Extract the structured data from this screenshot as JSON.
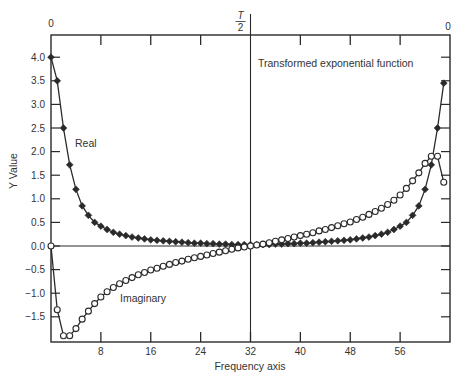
{
  "chart_data": {
    "type": "line",
    "title": "Transformed exponential function",
    "xlabel": "Frequency axis",
    "ylabel": "Y Value",
    "xlim": [
      0,
      64
    ],
    "ylim": [
      -2.0,
      4.3
    ],
    "x_ticks": [
      8,
      16,
      24,
      32,
      40,
      48,
      56
    ],
    "x_tick_labels": [
      "8",
      "16",
      "24",
      "32",
      "40",
      "48",
      "56"
    ],
    "y_ticks": [
      4.0,
      3.5,
      3.0,
      2.5,
      2.0,
      1.5,
      1.0,
      0.5,
      0.0,
      -0.5,
      -1.0,
      -1.5
    ],
    "y_tick_labels": [
      "4.0",
      "3.5",
      "3.0",
      "2.5",
      "2.0",
      "1.5",
      "1.0",
      "0.5",
      "0.0",
      "-0.5",
      "-1.0",
      "-1.5"
    ],
    "top_axis_labels": [
      {
        "x": 0,
        "label": "0"
      },
      {
        "x": 32,
        "label": "T/2"
      },
      {
        "x": 64,
        "label": "0"
      }
    ],
    "vertical_marker_x": 32,
    "grid": false,
    "legend": "inline annotations",
    "annotations": [
      {
        "text": "Real",
        "series": "Real"
      },
      {
        "text": "Imaginary",
        "series": "Imaginary"
      }
    ],
    "x": [
      0,
      1,
      2,
      3,
      4,
      5,
      6,
      7,
      8,
      9,
      10,
      11,
      12,
      13,
      14,
      15,
      16,
      17,
      18,
      19,
      20,
      21,
      22,
      23,
      24,
      25,
      26,
      27,
      28,
      29,
      30,
      31,
      32,
      33,
      34,
      35,
      36,
      37,
      38,
      39,
      40,
      41,
      42,
      43,
      44,
      45,
      46,
      47,
      48,
      49,
      50,
      51,
      52,
      53,
      54,
      55,
      56,
      57,
      58,
      59,
      60,
      61,
      62,
      63
    ],
    "series": [
      {
        "name": "Real",
        "marker": "filled-diamond",
        "values": [
          4.0,
          3.5,
          2.5,
          1.72,
          1.2,
          0.85,
          0.65,
          0.5,
          0.42,
          0.35,
          0.29,
          0.25,
          0.22,
          0.19,
          0.17,
          0.15,
          0.13,
          0.12,
          0.11,
          0.1,
          0.09,
          0.08,
          0.07,
          0.06,
          0.06,
          0.05,
          0.05,
          0.04,
          0.04,
          0.03,
          0.03,
          0.03,
          0.03,
          0.03,
          0.03,
          0.03,
          0.04,
          0.04,
          0.05,
          0.05,
          0.06,
          0.06,
          0.07,
          0.08,
          0.09,
          0.1,
          0.11,
          0.12,
          0.13,
          0.15,
          0.17,
          0.19,
          0.22,
          0.25,
          0.29,
          0.35,
          0.42,
          0.5,
          0.65,
          0.85,
          1.2,
          1.72,
          2.5,
          3.45
        ]
      },
      {
        "name": "Imaginary",
        "marker": "open-circle",
        "values": [
          0.0,
          -1.35,
          -1.9,
          -1.9,
          -1.75,
          -1.55,
          -1.38,
          -1.22,
          -1.08,
          -0.97,
          -0.88,
          -0.8,
          -0.73,
          -0.67,
          -0.61,
          -0.56,
          -0.51,
          -0.47,
          -0.43,
          -0.39,
          -0.35,
          -0.32,
          -0.28,
          -0.25,
          -0.22,
          -0.19,
          -0.16,
          -0.13,
          -0.1,
          -0.07,
          -0.04,
          -0.02,
          0.0,
          0.02,
          0.04,
          0.07,
          0.1,
          0.13,
          0.16,
          0.19,
          0.22,
          0.25,
          0.28,
          0.32,
          0.35,
          0.39,
          0.43,
          0.47,
          0.51,
          0.56,
          0.61,
          0.67,
          0.73,
          0.8,
          0.88,
          0.97,
          1.08,
          1.22,
          1.38,
          1.55,
          1.75,
          1.9,
          1.9,
          1.35
        ]
      }
    ]
  }
}
